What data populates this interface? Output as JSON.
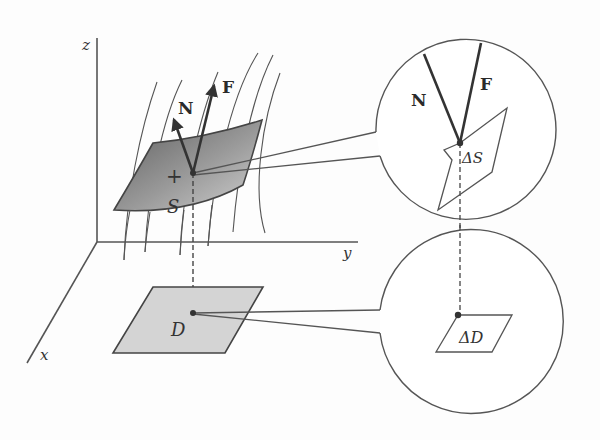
{
  "diagram": {
    "axes": {
      "z_label": "z",
      "y_label": "y",
      "x_label": "x"
    },
    "surface": {
      "label": "S",
      "orientation_mark": "+"
    },
    "vectors": {
      "normal_label": "N",
      "field_label": "F"
    },
    "region": {
      "label": "D"
    },
    "zoom_upper": {
      "normal_label": "N",
      "field_label": "F",
      "patch_label": "ΔS"
    },
    "zoom_lower": {
      "patch_label": "ΔD"
    },
    "colors": {
      "line": "#444444",
      "surface_dark": "#6f6f6f",
      "surface_light": "#c8c8c8",
      "region_fill": "#d4d4d4",
      "background": "#fdfdfd"
    }
  }
}
